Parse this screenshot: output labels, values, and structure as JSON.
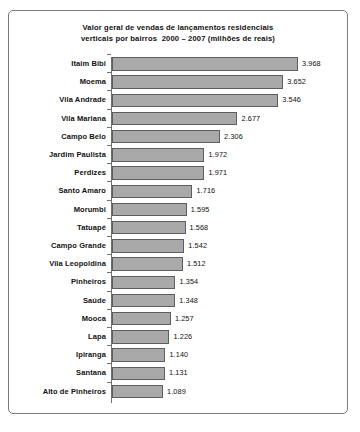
{
  "chart_data": {
    "type": "bar",
    "orientation": "horizontal",
    "title_lines": [
      "Valor geral de vendas de lançamentos residenciais",
      "verticais por bairros  2000 – 2007 (milhões de reais)"
    ],
    "title": "Valor geral de vendas de lançamentos residenciais verticais por bairros 2000 – 2007 (milhões de reais)",
    "xlabel": "",
    "ylabel": "",
    "grid": false,
    "legend": "none",
    "value_decimal_separator": ".",
    "bar_color": "#a9a9a9",
    "bar_border_color": "#5e5e5e",
    "axis_color": "#6f6f6f",
    "frame_color": "#7a7a7a",
    "categories": [
      "Itaim Bibi",
      "Moema",
      "Vila Andrade",
      "Vila Mariana",
      "Campo Belo",
      "Jardim Paulista",
      "Perdizes",
      "Santo Amaro",
      "Morumbi",
      "Tatuapé",
      "Campo Grande",
      "Vila Leopoldina",
      "Pinheiros",
      "Saúde",
      "Mooca",
      "Lapa",
      "Ipiranga",
      "Santana",
      "Alto de Pinheiros"
    ],
    "values": [
      3.968,
      3.652,
      3.546,
      2.677,
      2.306,
      1.972,
      1.971,
      1.716,
      1.595,
      1.568,
      1.542,
      1.512,
      1.354,
      1.348,
      1.257,
      1.226,
      1.14,
      1.131,
      1.089
    ],
    "value_labels": [
      "3.968",
      "3.652",
      "3.546",
      "2.677",
      "2.306",
      "1.972",
      "1.971",
      "1.716",
      "1.595",
      "1.568",
      "1.542",
      "1.512",
      "1.354",
      "1.348",
      "1.257",
      "1.226",
      "1.140",
      "1.131",
      "1.089"
    ],
    "xlim": [
      0.0,
      4.14
    ]
  }
}
